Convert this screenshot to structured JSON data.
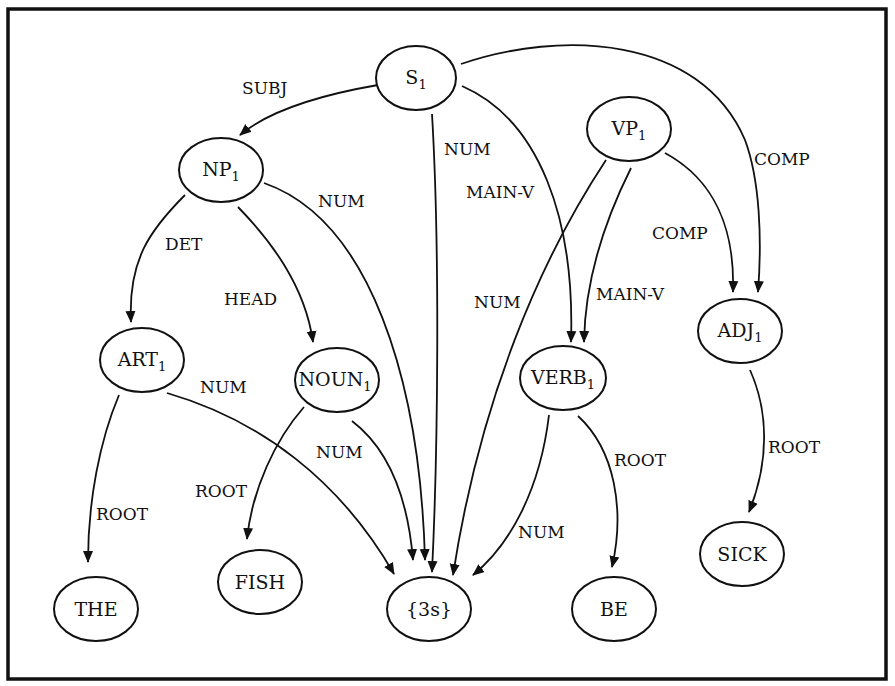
{
  "diagram": {
    "title": "",
    "type": "directed-acyclic-graph",
    "nodes": [
      {
        "id": "S1",
        "base": "S",
        "sub": "1"
      },
      {
        "id": "NP1",
        "base": "NP",
        "sub": "1"
      },
      {
        "id": "VP1",
        "base": "VP",
        "sub": "1"
      },
      {
        "id": "ART1",
        "base": "ART",
        "sub": "1"
      },
      {
        "id": "NOUN1",
        "base": "NOUN",
        "sub": "1"
      },
      {
        "id": "VERB1",
        "base": "VERB",
        "sub": "1"
      },
      {
        "id": "ADJ1",
        "base": "ADJ",
        "sub": "1"
      },
      {
        "id": "THE",
        "base": "THE",
        "sub": ""
      },
      {
        "id": "FISH",
        "base": "FISH",
        "sub": ""
      },
      {
        "id": "3s",
        "base": "{3s}",
        "sub": ""
      },
      {
        "id": "BE",
        "base": "BE",
        "sub": ""
      },
      {
        "id": "SICK",
        "base": "SICK",
        "sub": ""
      }
    ],
    "edges": [
      {
        "from": "S1",
        "to": "NP1",
        "label": "SUBJ"
      },
      {
        "from": "S1",
        "to": "3s",
        "label": "NUM"
      },
      {
        "from": "S1",
        "to": "VERB1",
        "label": "MAIN-V"
      },
      {
        "from": "S1",
        "to": "ADJ1",
        "label": "COMP"
      },
      {
        "from": "NP1",
        "to": "ART1",
        "label": "DET"
      },
      {
        "from": "NP1",
        "to": "NOUN1",
        "label": "HEAD"
      },
      {
        "from": "NP1",
        "to": "3s",
        "label": "NUM"
      },
      {
        "from": "VP1",
        "to": "3s",
        "label": "NUM"
      },
      {
        "from": "VP1",
        "to": "VERB1",
        "label": "MAIN-V"
      },
      {
        "from": "VP1",
        "to": "ADJ1",
        "label": "COMP"
      },
      {
        "from": "ART1",
        "to": "THE",
        "label": "ROOT"
      },
      {
        "from": "ART1",
        "to": "3s",
        "label": "NUM"
      },
      {
        "from": "NOUN1",
        "to": "FISH",
        "label": "ROOT"
      },
      {
        "from": "NOUN1",
        "to": "3s",
        "label": "NUM"
      },
      {
        "from": "VERB1",
        "to": "3s",
        "label": "NUM"
      },
      {
        "from": "VERB1",
        "to": "BE",
        "label": "ROOT"
      },
      {
        "from": "ADJ1",
        "to": "SICK",
        "label": "ROOT"
      }
    ]
  },
  "colors": {
    "stroke": "#111111",
    "background": "#ffffff"
  }
}
